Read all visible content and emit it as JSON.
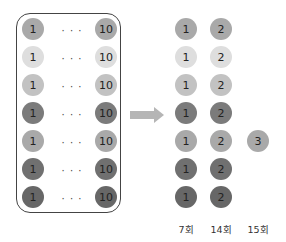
{
  "left_group": {
    "rows": [
      {
        "first": "1",
        "ellipsis": "· · ·",
        "last": "10",
        "color": "#a9a9a9"
      },
      {
        "first": "1",
        "ellipsis": "· · ·",
        "last": "10",
        "color": "#dedede"
      },
      {
        "first": "1",
        "ellipsis": "· · ·",
        "last": "10",
        "color": "#c2c2c2"
      },
      {
        "first": "1",
        "ellipsis": "· · ·",
        "last": "10",
        "color": "#7b7b7b"
      },
      {
        "first": "1",
        "ellipsis": "· · ·",
        "last": "10",
        "color": "#a9a9a9"
      },
      {
        "first": "1",
        "ellipsis": "· · ·",
        "last": "10",
        "color": "#707070"
      },
      {
        "first": "1",
        "ellipsis": "· · ·",
        "last": "10",
        "color": "#676767"
      }
    ]
  },
  "arrow": {
    "icon": "right-arrow-icon",
    "color": "#b0b0b0"
  },
  "right_group": {
    "columns": [
      {
        "label": "7회",
        "value": "1",
        "rows": [
          0,
          1,
          2,
          3,
          4,
          5,
          6
        ]
      },
      {
        "label": "14회",
        "value": "2",
        "rows": [
          0,
          1,
          2,
          3,
          4,
          5,
          6
        ]
      },
      {
        "label": "15회",
        "value": "3",
        "rows": [
          4
        ]
      }
    ]
  }
}
